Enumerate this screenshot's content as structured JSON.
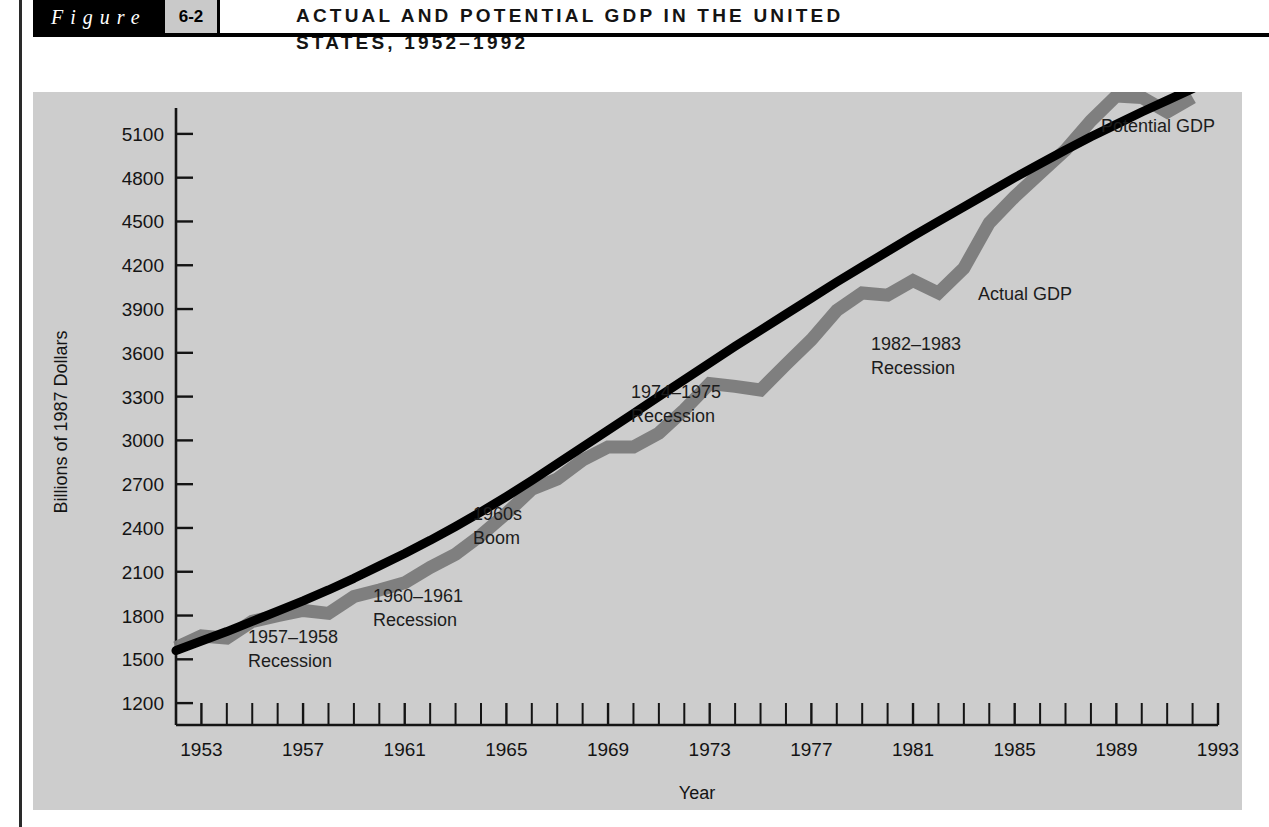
{
  "figure": {
    "word": "Figure",
    "number": "6-2",
    "title_line1": "ACTUAL AND POTENTIAL GDP IN THE UNITED",
    "title_line2": "STATES, 1952–1992"
  },
  "colors": {
    "panel_background": "#cdcdcd",
    "page_background": "#ffffff",
    "potential_line": "#000000",
    "actual_line": "#7a7a7a",
    "axis": "#141414",
    "header_band": "#000000",
    "number_badge": "#c9c9c9"
  },
  "chart_data": {
    "type": "line",
    "xlabel": "Year",
    "ylabel": "Billions of 1987 Dollars",
    "xlim": [
      1952,
      1993
    ],
    "ylim": [
      1050,
      5250
    ],
    "grid": false,
    "legend": "inline-annotations",
    "xticks_labeled": [
      1953,
      1957,
      1961,
      1965,
      1969,
      1973,
      1977,
      1981,
      1985,
      1989,
      1993
    ],
    "xticks_minor_step": 1,
    "yticks": [
      1200,
      1500,
      1800,
      2100,
      2400,
      2700,
      3000,
      3300,
      3600,
      3900,
      4200,
      4500,
      4800,
      5100
    ],
    "x": [
      1952,
      1953,
      1954,
      1955,
      1956,
      1957,
      1958,
      1959,
      1960,
      1961,
      1962,
      1963,
      1964,
      1965,
      1966,
      1967,
      1968,
      1969,
      1970,
      1971,
      1972,
      1973,
      1974,
      1975,
      1976,
      1977,
      1978,
      1979,
      1980,
      1981,
      1982,
      1983,
      1984,
      1985,
      1986,
      1987,
      1988,
      1989,
      1990,
      1991,
      1992
    ],
    "series": [
      {
        "name": "Potential GDP",
        "color": "#000000",
        "values": [
          1560,
          1625,
          1690,
          1760,
          1830,
          1900,
          1975,
          2055,
          2140,
          2225,
          2315,
          2410,
          2510,
          2615,
          2725,
          2840,
          2955,
          3070,
          3185,
          3300,
          3415,
          3530,
          3645,
          3755,
          3865,
          3975,
          4085,
          4190,
          4295,
          4400,
          4500,
          4600,
          4700,
          4800,
          4895,
          4990,
          5080,
          5165,
          5250,
          5330,
          5410
        ]
      },
      {
        "name": "Actual GDP",
        "color": "#7a7a7a",
        "values": [
          1580,
          1660,
          1645,
          1760,
          1800,
          1835,
          1815,
          1930,
          1975,
          2025,
          2130,
          2220,
          2350,
          2500,
          2665,
          2735,
          2865,
          2955,
          2955,
          3050,
          3210,
          3390,
          3370,
          3345,
          3520,
          3690,
          3890,
          4010,
          3995,
          4095,
          4010,
          4180,
          4490,
          4670,
          4830,
          4990,
          5190,
          5360,
          5350,
          5250,
          5350
        ]
      }
    ],
    "annotations": [
      {
        "text_line1": "1957–1958",
        "text_line2": "Recession",
        "x": 1957,
        "color": "#1c1c1c"
      },
      {
        "text_line1": "1960–1961",
        "text_line2": "Recession",
        "x": 1961,
        "color": "#1c1c1c"
      },
      {
        "text_line1": "1960s",
        "text_line2": "Boom",
        "x": 1966,
        "color": "#1c1c1c"
      },
      {
        "text_line1": "1974–1975",
        "text_line2": "Recession",
        "x": 1975,
        "color": "#1c1c1c"
      },
      {
        "text_line1": "1982–1983",
        "text_line2": "Recession",
        "x": 1983,
        "color": "#1c1c1c"
      },
      {
        "text_line1": "Actual GDP",
        "text_line2": "",
        "x": 1986,
        "color": "#6d6d6d"
      },
      {
        "text_line1": "Potential GDP",
        "text_line2": "",
        "x": 1990,
        "color": "#1c1c1c"
      }
    ]
  },
  "labels": {
    "y_axis_title": "Billions of 1987 Dollars",
    "x_axis_title": "Year",
    "potential_gdp": "Potential GDP",
    "actual_gdp": "Actual GDP",
    "recession_1957_l1": "1957–1958",
    "recession_1957_l2": "Recession",
    "recession_1960_l1": "1960–1961",
    "recession_1960_l2": "Recession",
    "boom_1960s_l1": "1960s",
    "boom_1960s_l2": "Boom",
    "recession_1974_l1": "1974–1975",
    "recession_1974_l2": "Recession",
    "recession_1982_l1": "1982–1983",
    "recession_1982_l2": "Recession"
  }
}
